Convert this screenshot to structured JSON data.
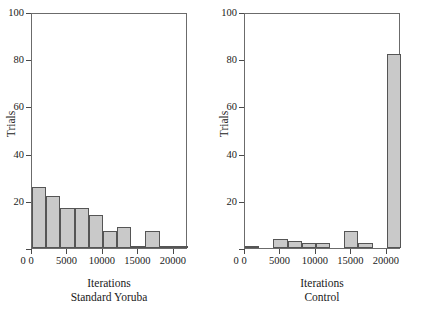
{
  "figure": {
    "panels": [
      {
        "name": "standard-yoruba",
        "ylabel": "Trials",
        "xlabel_line1": "Iterations",
        "xlabel_line2": "Standard Yoruba"
      },
      {
        "name": "control",
        "ylabel": "Trials",
        "xlabel_line1": "Iterations",
        "xlabel_line2": "Control"
      }
    ]
  },
  "chart_data": [
    {
      "type": "bar",
      "title": "",
      "subtitle": "Standard Yoruba",
      "xlabel": "Iterations",
      "ylabel": "Trials",
      "xlim": [
        0,
        22000
      ],
      "ylim": [
        0,
        100
      ],
      "grid": false,
      "legend": null,
      "bin_width": 2000,
      "xticks": [
        0,
        5000,
        10000,
        15000,
        20000
      ],
      "xticklabels": [
        "0",
        "5000",
        "10000",
        "15000",
        "20000"
      ],
      "yticks": [
        0,
        20,
        40,
        60,
        80,
        100
      ],
      "yticklabels": [
        "0",
        "20",
        "40",
        "60",
        "80",
        "100"
      ],
      "bin_edges": [
        0,
        2000,
        4000,
        6000,
        8000,
        10000,
        12000,
        14000,
        16000,
        18000,
        20000,
        22000
      ],
      "categories": [
        "0-2000",
        "2000-4000",
        "4000-6000",
        "6000-8000",
        "8000-10000",
        "10000-12000",
        "12000-14000",
        "14000-16000",
        "16000-18000",
        "18000-20000",
        "20000-22000"
      ],
      "values": [
        26,
        22,
        17,
        17,
        14,
        7,
        9,
        1,
        7,
        1,
        1
      ],
      "bar_fill": "#c9c9c9",
      "bar_edge": "#555555"
    },
    {
      "type": "bar",
      "title": "",
      "subtitle": "Control",
      "xlabel": "Iterations",
      "ylabel": "Trials",
      "xlim": [
        0,
        22000
      ],
      "ylim": [
        0,
        100
      ],
      "grid": false,
      "legend": null,
      "bin_width": 2000,
      "xticks": [
        0,
        5000,
        10000,
        15000,
        20000
      ],
      "xticklabels": [
        "0",
        "5000",
        "10000",
        "15000",
        "20000"
      ],
      "yticks": [
        0,
        20,
        40,
        60,
        80,
        100
      ],
      "yticklabels": [
        "0",
        "20",
        "40",
        "60",
        "80",
        "100"
      ],
      "bin_edges": [
        0,
        2000,
        4000,
        6000,
        8000,
        10000,
        12000,
        14000,
        16000,
        18000,
        20000,
        22000
      ],
      "categories": [
        "0-2000",
        "2000-4000",
        "4000-6000",
        "6000-8000",
        "8000-10000",
        "10000-12000",
        "12000-14000",
        "14000-16000",
        "16000-18000",
        "18000-20000",
        "20000-22000"
      ],
      "values": [
        1,
        0,
        4,
        3,
        2,
        2,
        0,
        7,
        2,
        0,
        82
      ],
      "bar_fill": "#c9c9c9",
      "bar_edge": "#555555"
    }
  ]
}
